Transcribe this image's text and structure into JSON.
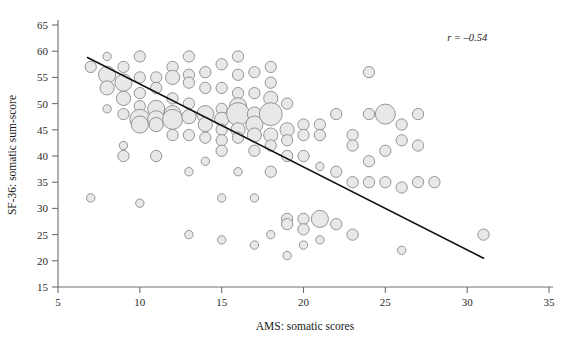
{
  "chart_data": {
    "type": "scatter",
    "title": "",
    "xlabel": "AMS: somatic scores",
    "ylabel": "SF-36: somatic sum-score",
    "xlim": [
      5,
      35
    ],
    "ylim": [
      15,
      65
    ],
    "xticks": [
      5,
      10,
      15,
      20,
      25,
      30,
      35
    ],
    "yticks": [
      15,
      20,
      25,
      30,
      35,
      40,
      45,
      50,
      55,
      60,
      65
    ],
    "xtick_labels": [
      "5",
      "10",
      "15",
      "20",
      "25",
      "30",
      "35"
    ],
    "ytick_labels": [
      "15",
      "20",
      "25",
      "30",
      "35",
      "40",
      "45",
      "50",
      "55",
      "60",
      "65"
    ],
    "grid": false,
    "legend": null,
    "annotations": [
      {
        "name": "correlation",
        "text": "r = –0.54",
        "x": 30.0,
        "y": 62.0
      }
    ],
    "marker_style": {
      "shape": "circle",
      "fill_color": "#e8e8e8",
      "edge_color": "#8a8a8a",
      "note": "bubble area proportional to number of overlapping observations"
    },
    "trendline": {
      "type": "linear-fit",
      "color": "#111111",
      "x_start": 6.8,
      "y_start": 58.8,
      "x_end": 31.0,
      "y_end": 20.5
    },
    "points": [
      {
        "x": 7,
        "y": 57,
        "s": 3
      },
      {
        "x": 7,
        "y": 32,
        "s": 2
      },
      {
        "x": 8,
        "y": 59,
        "s": 2
      },
      {
        "x": 8,
        "y": 55.5,
        "s": 5
      },
      {
        "x": 8,
        "y": 53,
        "s": 4
      },
      {
        "x": 8,
        "y": 49,
        "s": 2
      },
      {
        "x": 9,
        "y": 57,
        "s": 3
      },
      {
        "x": 9,
        "y": 54,
        "s": 5
      },
      {
        "x": 9,
        "y": 51,
        "s": 4
      },
      {
        "x": 9,
        "y": 48,
        "s": 3
      },
      {
        "x": 9,
        "y": 42,
        "s": 2
      },
      {
        "x": 9,
        "y": 40,
        "s": 3
      },
      {
        "x": 10,
        "y": 59,
        "s": 3
      },
      {
        "x": 10,
        "y": 55,
        "s": 3
      },
      {
        "x": 10,
        "y": 52,
        "s": 3
      },
      {
        "x": 10,
        "y": 49.5,
        "s": 3
      },
      {
        "x": 10,
        "y": 47,
        "s": 6
      },
      {
        "x": 10,
        "y": 46,
        "s": 5
      },
      {
        "x": 10,
        "y": 31,
        "s": 2
      },
      {
        "x": 11,
        "y": 55,
        "s": 3
      },
      {
        "x": 11,
        "y": 53,
        "s": 3
      },
      {
        "x": 11,
        "y": 49,
        "s": 5
      },
      {
        "x": 11,
        "y": 47,
        "s": 5
      },
      {
        "x": 11,
        "y": 46,
        "s": 4
      },
      {
        "x": 11,
        "y": 40,
        "s": 3
      },
      {
        "x": 12,
        "y": 57,
        "s": 3
      },
      {
        "x": 12,
        "y": 55,
        "s": 4
      },
      {
        "x": 12,
        "y": 51,
        "s": 3
      },
      {
        "x": 12,
        "y": 48,
        "s": 5
      },
      {
        "x": 12,
        "y": 47,
        "s": 6
      },
      {
        "x": 12,
        "y": 44,
        "s": 3
      },
      {
        "x": 13,
        "y": 59,
        "s": 3
      },
      {
        "x": 13,
        "y": 55.5,
        "s": 3
      },
      {
        "x": 13,
        "y": 54,
        "s": 3
      },
      {
        "x": 13,
        "y": 50,
        "s": 3
      },
      {
        "x": 13,
        "y": 47.5,
        "s": 4
      },
      {
        "x": 13,
        "y": 44,
        "s": 3
      },
      {
        "x": 13,
        "y": 37,
        "s": 2
      },
      {
        "x": 13,
        "y": 25,
        "s": 2
      },
      {
        "x": 14,
        "y": 56,
        "s": 3
      },
      {
        "x": 14,
        "y": 53,
        "s": 3
      },
      {
        "x": 14,
        "y": 48,
        "s": 5
      },
      {
        "x": 14,
        "y": 46,
        "s": 4
      },
      {
        "x": 14,
        "y": 43.5,
        "s": 3
      },
      {
        "x": 14,
        "y": 39,
        "s": 2
      },
      {
        "x": 15,
        "y": 57.5,
        "s": 3
      },
      {
        "x": 15,
        "y": 53,
        "s": 3
      },
      {
        "x": 15,
        "y": 49,
        "s": 3
      },
      {
        "x": 15,
        "y": 47,
        "s": 4
      },
      {
        "x": 15,
        "y": 45,
        "s": 3
      },
      {
        "x": 15,
        "y": 43,
        "s": 3
      },
      {
        "x": 15,
        "y": 41,
        "s": 3
      },
      {
        "x": 15,
        "y": 32,
        "s": 2
      },
      {
        "x": 15,
        "y": 24,
        "s": 2
      },
      {
        "x": 16,
        "y": 59,
        "s": 3
      },
      {
        "x": 16,
        "y": 55.5,
        "s": 3
      },
      {
        "x": 16,
        "y": 52,
        "s": 3
      },
      {
        "x": 16,
        "y": 49.5,
        "s": 5
      },
      {
        "x": 16,
        "y": 48,
        "s": 7
      },
      {
        "x": 16,
        "y": 45,
        "s": 4
      },
      {
        "x": 16,
        "y": 43.5,
        "s": 3
      },
      {
        "x": 16,
        "y": 37,
        "s": 2
      },
      {
        "x": 17,
        "y": 56,
        "s": 3
      },
      {
        "x": 17,
        "y": 52,
        "s": 3
      },
      {
        "x": 17,
        "y": 48,
        "s": 4
      },
      {
        "x": 17,
        "y": 46,
        "s": 5
      },
      {
        "x": 17,
        "y": 44,
        "s": 4
      },
      {
        "x": 17,
        "y": 41,
        "s": 3
      },
      {
        "x": 17,
        "y": 32,
        "s": 2
      },
      {
        "x": 17,
        "y": 23,
        "s": 2
      },
      {
        "x": 18,
        "y": 57,
        "s": 3
      },
      {
        "x": 18,
        "y": 54,
        "s": 3
      },
      {
        "x": 18,
        "y": 51,
        "s": 4
      },
      {
        "x": 18,
        "y": 48,
        "s": 7
      },
      {
        "x": 18,
        "y": 44,
        "s": 4
      },
      {
        "x": 18,
        "y": 42,
        "s": 3
      },
      {
        "x": 18,
        "y": 37,
        "s": 3
      },
      {
        "x": 18,
        "y": 25,
        "s": 2
      },
      {
        "x": 19,
        "y": 50,
        "s": 3
      },
      {
        "x": 19,
        "y": 45,
        "s": 4
      },
      {
        "x": 19,
        "y": 43,
        "s": 3
      },
      {
        "x": 19,
        "y": 40,
        "s": 3
      },
      {
        "x": 19,
        "y": 28,
        "s": 3
      },
      {
        "x": 19,
        "y": 27,
        "s": 3
      },
      {
        "x": 19,
        "y": 21,
        "s": 2
      },
      {
        "x": 20,
        "y": 46,
        "s": 3
      },
      {
        "x": 20,
        "y": 44,
        "s": 3
      },
      {
        "x": 20,
        "y": 40,
        "s": 3
      },
      {
        "x": 20,
        "y": 28,
        "s": 3
      },
      {
        "x": 20,
        "y": 26,
        "s": 3
      },
      {
        "x": 20,
        "y": 23,
        "s": 2
      },
      {
        "x": 21,
        "y": 46,
        "s": 3
      },
      {
        "x": 21,
        "y": 44,
        "s": 3
      },
      {
        "x": 21,
        "y": 38,
        "s": 2
      },
      {
        "x": 21,
        "y": 28,
        "s": 5
      },
      {
        "x": 21,
        "y": 24,
        "s": 2
      },
      {
        "x": 22,
        "y": 48,
        "s": 3
      },
      {
        "x": 22,
        "y": 37,
        "s": 3
      },
      {
        "x": 22,
        "y": 27,
        "s": 3
      },
      {
        "x": 23,
        "y": 44,
        "s": 3
      },
      {
        "x": 23,
        "y": 42,
        "s": 3
      },
      {
        "x": 23,
        "y": 35,
        "s": 3
      },
      {
        "x": 23,
        "y": 25,
        "s": 3
      },
      {
        "x": 24,
        "y": 56,
        "s": 3
      },
      {
        "x": 24,
        "y": 48,
        "s": 3
      },
      {
        "x": 24,
        "y": 39,
        "s": 3
      },
      {
        "x": 24,
        "y": 35,
        "s": 3
      },
      {
        "x": 25,
        "y": 48,
        "s": 6
      },
      {
        "x": 25,
        "y": 41,
        "s": 3
      },
      {
        "x": 25,
        "y": 35,
        "s": 3
      },
      {
        "x": 26,
        "y": 46,
        "s": 3
      },
      {
        "x": 26,
        "y": 43,
        "s": 3
      },
      {
        "x": 26,
        "y": 34,
        "s": 3
      },
      {
        "x": 26,
        "y": 22,
        "s": 2
      },
      {
        "x": 27,
        "y": 48,
        "s": 3
      },
      {
        "x": 27,
        "y": 42,
        "s": 3
      },
      {
        "x": 27,
        "y": 35,
        "s": 3
      },
      {
        "x": 28,
        "y": 35,
        "s": 3
      },
      {
        "x": 31,
        "y": 25,
        "s": 3
      }
    ]
  }
}
